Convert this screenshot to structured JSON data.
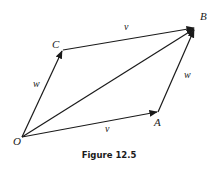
{
  "figure": {
    "caption": "Figure 12.5",
    "points": {
      "O": "O",
      "A": "A",
      "B": "B",
      "C": "C"
    },
    "vectors": {
      "OA": "v⃗",
      "CB": "v⃗",
      "OC": "w⃗",
      "AB": "w⃗"
    },
    "arrow_color": "#1a1a1a"
  }
}
